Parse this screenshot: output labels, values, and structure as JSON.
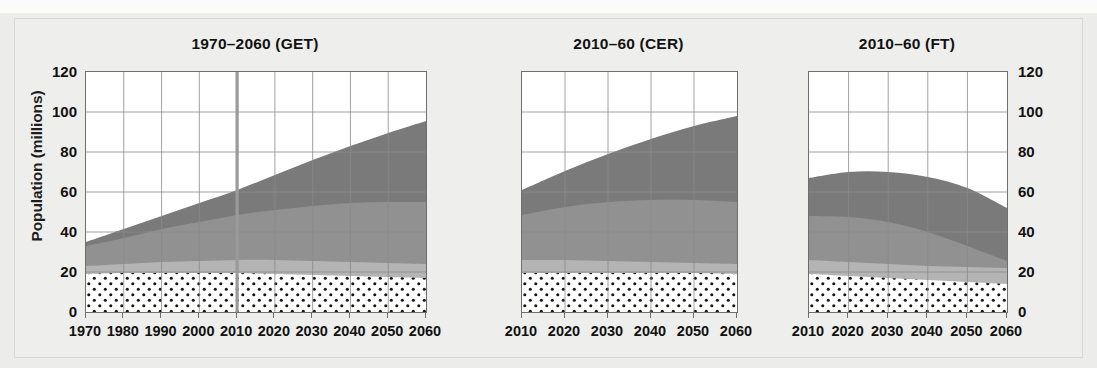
{
  "figure": {
    "y_axis_label": "Population (millions)",
    "background_color": "#eeeeec"
  },
  "axis": {
    "y_ticks": [
      0,
      20,
      40,
      60,
      80,
      100,
      120
    ],
    "y_min": 0,
    "y_max": 120,
    "y_tick_labels": [
      "0",
      "20",
      "40",
      "60",
      "80",
      "100",
      "120"
    ]
  },
  "panels": [
    {
      "title": "1970–2060 (GET)",
      "x_min": 1970,
      "x_max": 2060,
      "x_tick_labels": [
        "1970",
        "1980",
        "1990",
        "2000",
        "2010",
        "2020",
        "2030",
        "2040",
        "2050",
        "2060"
      ],
      "divider_year": 2010
    },
    {
      "title": "2010–60 (CER)",
      "x_min": 2010,
      "x_max": 2060,
      "x_tick_labels": [
        "2010",
        "2020",
        "2030",
        "2040",
        "2050",
        "2060"
      ],
      "divider_year": null
    },
    {
      "title": "2010–60 (FT)",
      "x_min": 2010,
      "x_max": 2060,
      "x_tick_labels": [
        "2010",
        "2020",
        "2030",
        "2040",
        "2050",
        "2060"
      ],
      "divider_year": null
    }
  ],
  "colors": {
    "layer_dotted_fill": "#ffffff",
    "layer_dotted_dot": "#151515",
    "layer_light": "#b4b4b4",
    "layer_medium": "#919191",
    "layer_dark": "#7a7a7a",
    "plot_border": "#6e6e6e",
    "grid": "#8a8a8a",
    "divider_line": "#9a9a9a",
    "text": "#111111"
  },
  "chart_data": {
    "type": "area",
    "subtitle": "",
    "xlabel": "",
    "ylabel": "Population (millions)",
    "ylim": [
      0,
      120
    ],
    "grid": true,
    "legend_position": "none",
    "stacked": true,
    "series_order": [
      "dotted",
      "light",
      "medium",
      "dark"
    ],
    "panels": [
      {
        "name": "1970–2060 (GET)",
        "x": [
          1970,
          1980,
          1990,
          2000,
          2010,
          2020,
          2030,
          2040,
          2050,
          2060
        ],
        "cumulative_tops": {
          "dotted": [
            19,
            19.5,
            19.5,
            19.5,
            19.5,
            19,
            18.5,
            18,
            17.5,
            17
          ],
          "light": [
            23,
            24,
            25,
            25.5,
            26,
            26,
            25.5,
            25,
            24.5,
            24
          ],
          "medium": [
            33,
            37,
            41.5,
            45,
            48.5,
            51,
            53,
            54.5,
            55,
            55
          ],
          "dark": [
            35,
            41.5,
            48,
            54.5,
            61,
            68.5,
            76,
            83,
            89.5,
            95.5
          ]
        }
      },
      {
        "name": "2010–60 (CER)",
        "x": [
          2010,
          2020,
          2030,
          2040,
          2050,
          2060
        ],
        "cumulative_tops": {
          "dotted": [
            19.5,
            19.5,
            19.5,
            19.5,
            19.5,
            19
          ],
          "light": [
            26,
            26,
            25.5,
            25,
            24.5,
            24
          ],
          "medium": [
            48.5,
            52.5,
            55,
            56,
            56,
            55
          ],
          "dark": [
            61,
            70.5,
            79,
            86.5,
            93,
            98
          ]
        },
        "total_top": [
          71,
          81,
          89.5,
          96,
          101,
          104
        ]
      },
      {
        "name": "2010–60 (FT)",
        "x": [
          2010,
          2020,
          2030,
          2040,
          2050,
          2060
        ],
        "cumulative_tops": {
          "dotted": [
            19,
            18,
            17,
            16,
            15,
            14
          ],
          "light": [
            26,
            25,
            24,
            23,
            22.5,
            22
          ],
          "medium": [
            48,
            47.5,
            45,
            40,
            33,
            25.5
          ],
          "dark": [
            67,
            70,
            70,
            67.5,
            62,
            52
          ]
        },
        "total_top": [
          77,
          84,
          88.5,
          90.5,
          91,
          91
        ]
      }
    ]
  }
}
